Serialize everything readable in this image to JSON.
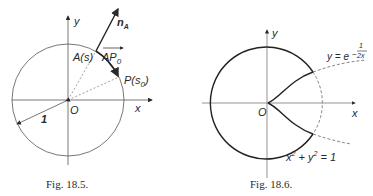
{
  "figures": [
    {
      "caption": "Fig. 18.5.",
      "labels": {
        "y_axis": "y",
        "x_axis": "x",
        "origin": "O",
        "normal": "n",
        "normal_sub": "A",
        "point_a": "A(s)",
        "vector": "AP",
        "vector_sub": "0",
        "point_p": "P(s",
        "point_p_sub": "0",
        "point_p_close": ")",
        "radius": "1"
      }
    },
    {
      "caption": "Fig. 18.6.",
      "labels": {
        "y_axis": "y",
        "x_axis": "x",
        "origin": "O",
        "curve_eq": "y = e",
        "curve_exp_num": "1",
        "curve_exp_den": "2x",
        "curve_exp_sign": "−",
        "circle_eq_x": "x",
        "circle_eq_plus": " + y",
        "circle_eq_end": " = 1",
        "sup2": "2"
      }
    }
  ],
  "colors": {
    "ink": "#2a2a2a",
    "background": "#ffffff"
  }
}
